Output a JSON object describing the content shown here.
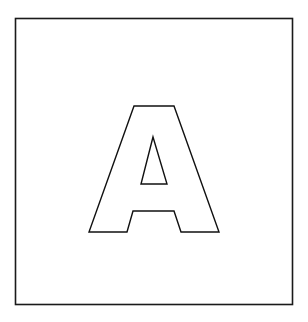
{
  "figure": {
    "letter": "A",
    "frame_color": "#1a1a1a",
    "background": "#ffffff",
    "frame": {
      "x": 15,
      "y": 18,
      "width": 277,
      "height": 286
    },
    "letter_outline": "134,106 174,106 219,232 181,232 174,211 133,211 127,232 89,232",
    "counter_triangle": "153,137 167,184 141,184"
  }
}
